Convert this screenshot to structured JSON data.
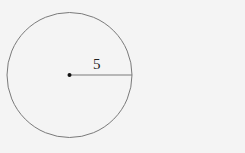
{
  "diagram": {
    "shape": "circle",
    "radius_label": "5",
    "colors": {
      "stroke": "#7a7a7a",
      "center": "#111111",
      "background": "#f4f4f4"
    }
  }
}
